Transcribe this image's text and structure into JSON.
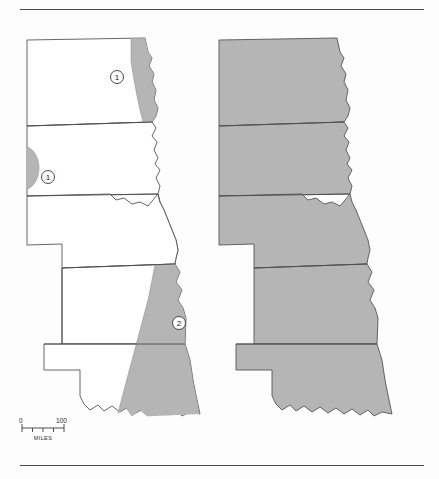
{
  "figure": {
    "title": "",
    "background_color": "#fdfdfd",
    "rules": {
      "top_label": "top-divider-rule",
      "bottom_label": "bottom-divider-rule",
      "color": "#4a4a4a"
    }
  },
  "colors": {
    "shade_fill": "#b5b5b5",
    "unshaded_fill": "#ffffff",
    "outline_stroke": "#555555",
    "internal_border": "#4d4d4d",
    "callout_stroke": "#333333",
    "rule": "#4a4a4a"
  },
  "panels": [
    {
      "id": "left-panel",
      "name": "left-map",
      "fill_mode": "partial-shaded",
      "states": [
        {
          "name": "north-dakota",
          "shaded": false
        },
        {
          "name": "south-dakota",
          "shaded": false
        },
        {
          "name": "nebraska",
          "shaded": false
        },
        {
          "name": "kansas",
          "shaded": false
        },
        {
          "name": "oklahoma",
          "shaded": false
        }
      ],
      "shaded_patches": [
        {
          "name": "patch-northeast-north-dakota",
          "region": "eastern North Dakota / Red River valley"
        },
        {
          "name": "patch-west-south-dakota",
          "region": "western South Dakota edge"
        },
        {
          "name": "patch-east-kansas-oklahoma",
          "region": "eastern Kansas and eastern Oklahoma"
        }
      ],
      "callouts": [
        {
          "name": "callout-1-north",
          "label": "1",
          "x": 117,
          "y": 77
        },
        {
          "name": "callout-1-west",
          "label": "1",
          "x": 48,
          "y": 177
        },
        {
          "name": "callout-2-southeast",
          "label": "2",
          "x": 179,
          "y": 323
        }
      ]
    },
    {
      "id": "right-panel",
      "name": "right-map",
      "fill_mode": "fully-shaded",
      "states": [
        {
          "name": "north-dakota",
          "shaded": true
        },
        {
          "name": "south-dakota",
          "shaded": true
        },
        {
          "name": "nebraska",
          "shaded": true
        },
        {
          "name": "kansas",
          "shaded": true
        },
        {
          "name": "oklahoma",
          "shaded": true
        }
      ],
      "shaded_patches": [],
      "callouts": []
    }
  ],
  "scale_bar": {
    "name": "scale-bar",
    "start_label": "0",
    "end_label": "100",
    "unit_label": "MILES",
    "ticks": 4
  }
}
